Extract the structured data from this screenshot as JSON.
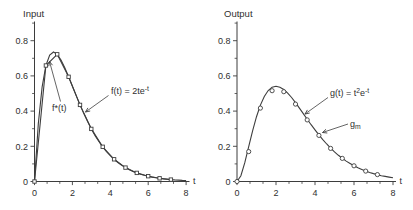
{
  "figure": {
    "background": "#ffffff",
    "line_color": "#3d3d3d",
    "text_color": "#2f2f2f"
  },
  "chart_data": [
    {
      "type": "line",
      "title": "Input",
      "xlabel": "t",
      "xlim": [
        0,
        8
      ],
      "ylim": [
        0,
        0.9
      ],
      "grid": false,
      "xticks": [
        0,
        2,
        4,
        6,
        8
      ],
      "xminorticks": [
        0.667,
        1.333,
        2.667,
        3.333,
        4.667,
        5.333,
        6.667,
        7.333
      ],
      "yticks": [
        0,
        0.2,
        0.4,
        0.6,
        0.8
      ],
      "yminorticks": [
        0.1,
        0.3,
        0.5,
        0.7,
        0.9
      ],
      "series": [
        {
          "id": "f-curve",
          "name": "f(t) = 2te^-t",
          "kind": "curve",
          "x_start": 0,
          "x_step": 0.2,
          "y": [
            0,
            0.327,
            0.536,
            0.659,
            0.719,
            0.736,
            0.723,
            0.69,
            0.646,
            0.595,
            0.541,
            0.488,
            0.435,
            0.386,
            0.341,
            0.299,
            0.261,
            0.227,
            0.197,
            0.17,
            0.147,
            0.126,
            0.108,
            0.092,
            0.079,
            0.067,
            0.057,
            0.049,
            0.041,
            0.035,
            0.03,
            0.025,
            0.021,
            0.018,
            0.015,
            0.013,
            0.011,
            0.009,
            0.008,
            0.006,
            0.005
          ]
        },
        {
          "id": "f-star-samples",
          "name": "f*(t)",
          "kind": "samples",
          "marker": "square",
          "connected": true,
          "x": [
            0,
            0.6,
            1.2,
            1.8,
            2.4,
            3.0,
            3.6,
            4.2,
            4.8,
            5.4,
            6.0,
            6.6,
            7.2
          ],
          "y": [
            0,
            0.659,
            0.723,
            0.595,
            0.435,
            0.299,
            0.197,
            0.126,
            0.079,
            0.049,
            0.03,
            0.018,
            0.011
          ]
        }
      ],
      "annotations": [
        {
          "id": "f-star-label",
          "text": "f*(t)",
          "segments": [
            {
              "t": "f*(t)"
            }
          ],
          "layout_px": {
            "label": [
              52,
              111
            ],
            "arrow_from": [
              60.5,
              101.5
            ],
            "arrow_to": [
              49.5,
              61.5
            ]
          }
        },
        {
          "id": "f-curve-label",
          "text": "f(t) = 2te^-t",
          "segments": [
            {
              "t": "f(t) = 2te"
            },
            {
              "t": "-t",
              "s": "sup"
            }
          ],
          "layout_px": {
            "label": [
              111,
              94
            ],
            "arrow_from": [
              108.5,
              95.5
            ],
            "arrow_to": [
              85.5,
              112
            ]
          }
        }
      ]
    },
    {
      "type": "line",
      "title": "Output",
      "xlabel": "t",
      "xlim": [
        0,
        8
      ],
      "ylim": [
        0,
        0.9
      ],
      "grid": false,
      "xticks": [
        0,
        2,
        4,
        6,
        8
      ],
      "xminorticks": [
        0.667,
        1.333,
        2.667,
        3.333,
        4.667,
        5.333,
        6.667,
        7.333
      ],
      "yticks": [
        0,
        0.2,
        0.4,
        0.6,
        0.8
      ],
      "yminorticks": [
        0.1,
        0.3,
        0.5,
        0.7,
        0.9
      ],
      "series": [
        {
          "id": "g-curve",
          "name": "g(t) = t^2 e^-t",
          "kind": "curve",
          "x_start": 0,
          "x_step": 0.2,
          "y": [
            0,
            0.033,
            0.107,
            0.198,
            0.288,
            0.368,
            0.434,
            0.483,
            0.517,
            0.536,
            0.541,
            0.536,
            0.523,
            0.502,
            0.477,
            0.448,
            0.417,
            0.386,
            0.354,
            0.323,
            0.293,
            0.265,
            0.238,
            0.213,
            0.19,
            0.168,
            0.149,
            0.132,
            0.116,
            0.102,
            0.089,
            0.078,
            0.068,
            0.059,
            0.051,
            0.045,
            0.039,
            0.033,
            0.029,
            0.025,
            0.021
          ]
        },
        {
          "id": "g-m-samples",
          "name": "g_m",
          "kind": "samples",
          "marker": "circle",
          "connected": false,
          "x": [
            0,
            0.6,
            1.2,
            1.8,
            2.4,
            3.0,
            3.6,
            4.2,
            4.8,
            5.4,
            6.0,
            6.6,
            7.2
          ],
          "y": [
            0,
            0.17,
            0.417,
            0.516,
            0.51,
            0.44,
            0.35,
            0.262,
            0.188,
            0.131,
            0.089,
            0.059,
            0.039
          ]
        }
      ],
      "annotations": [
        {
          "id": "g-curve-label",
          "text": "g(t) = t^2 e^-t",
          "segments": [
            {
              "t": "g(t) = t"
            },
            {
              "t": "2",
              "s": "sup"
            },
            {
              "t": "e"
            },
            {
              "t": "-t",
              "s": "sup"
            }
          ],
          "layout_px": {
            "label": [
              330,
              96
            ],
            "arrow_from": [
              328,
              97.5
            ],
            "arrow_to": [
              305,
              114
            ]
          }
        },
        {
          "id": "g-m-label",
          "text": "g_m",
          "segments": [
            {
              "t": "g"
            },
            {
              "t": "m",
              "s": "sub"
            }
          ],
          "layout_px": {
            "label": [
              350,
              127
            ],
            "arrow_from": [
              348,
              124
            ],
            "arrow_to": [
              322.5,
              132.5
            ]
          }
        }
      ]
    }
  ]
}
